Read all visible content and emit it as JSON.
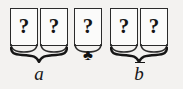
{
  "figure": {
    "name": "card-sequence-with-grouping-braces",
    "background_color": "#f3f2f0",
    "ink_color": "#161616",
    "cards": [
      {
        "id": "card-1",
        "face": "?",
        "x": 10
      },
      {
        "id": "card-2",
        "face": "?",
        "x": 40
      },
      {
        "id": "card-3",
        "face": "?",
        "x": 74
      },
      {
        "id": "card-4",
        "face": "?",
        "x": 110
      },
      {
        "id": "card-5",
        "face": "?",
        "x": 140
      }
    ],
    "suit_marker": {
      "name": "club-suit-symbol",
      "glyph": "♣",
      "x": 79,
      "y": 48
    },
    "braces": [
      {
        "id": "brace-a",
        "covers": "card-1,card-2",
        "x": 10,
        "width": 58,
        "label": "a",
        "label_overline": false,
        "label_x": 10,
        "label_y": 64
      },
      {
        "id": "brace-b-bar",
        "covers": "card-4,card-5",
        "x": 110,
        "width": 58,
        "label": "b",
        "label_overline": true,
        "label_x": 110,
        "label_y": 64
      }
    ]
  }
}
